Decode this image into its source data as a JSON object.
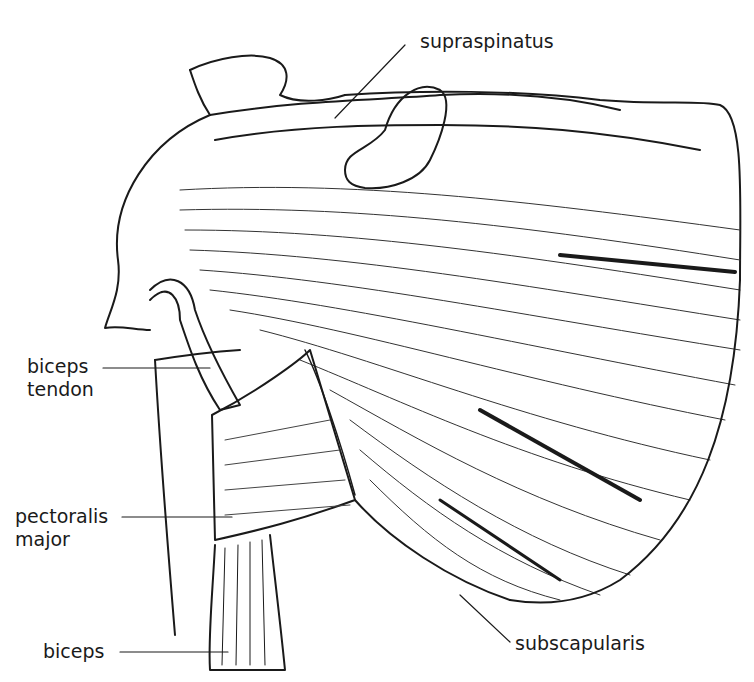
{
  "diagram": {
    "labels": {
      "supraspinatus": "supraspinatus",
      "biceps_tendon_1": "biceps",
      "biceps_tendon_2": "tendon",
      "pectoralis_1": "pectoralis",
      "pectoralis_2": "major",
      "biceps": "biceps",
      "subscapularis": "subscapularis"
    },
    "colors": {
      "ink": "#1a1a1a",
      "background": "#ffffff"
    }
  }
}
